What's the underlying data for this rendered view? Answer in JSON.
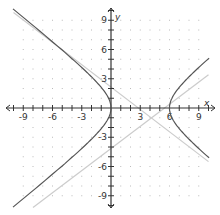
{
  "chart_data": {
    "type": "line",
    "title": "",
    "xlabel": "x",
    "ylabel": "y",
    "xlim": [
      -10,
      10
    ],
    "ylim": [
      -10,
      10
    ],
    "grid": "dots",
    "x_tick_labels": [
      "-9",
      "-6",
      "-3",
      "3",
      "6",
      "9"
    ],
    "y_tick_labels": [
      "9",
      "6",
      "3",
      "-3",
      "-6",
      "-9"
    ],
    "series": [
      {
        "name": "hyperbola",
        "kind": "curve",
        "color": "#555555",
        "description": "horizontal hyperbola, vertices at (0,0) and (6,0), center (3,0)"
      },
      {
        "name": "asymptote-1",
        "kind": "line",
        "color": "#cccccc",
        "points": [
          [
            -10,
            9.8
          ],
          [
            10,
            -5.5
          ]
        ]
      },
      {
        "name": "asymptote-2",
        "kind": "line",
        "color": "#cccccc",
        "points": [
          [
            -8,
            -10.2
          ],
          [
            10,
            3.4
          ]
        ]
      }
    ]
  },
  "axes": {
    "x_label": "x",
    "y_label": "y"
  }
}
